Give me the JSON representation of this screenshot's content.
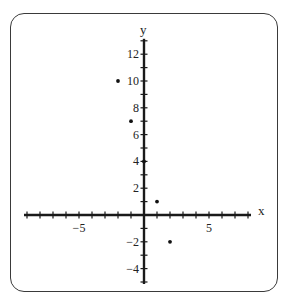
{
  "chart_data": {
    "type": "scatter",
    "title": "",
    "xlabel": "x",
    "ylabel": "y",
    "xlim": [
      -9,
      8
    ],
    "ylim": [
      -5,
      13
    ],
    "x_tick_labels": [
      {
        "value": -5,
        "label": "−5"
      },
      {
        "value": 5,
        "label": "5"
      }
    ],
    "y_tick_labels": [
      {
        "value": 12,
        "label": "12"
      },
      {
        "value": 10,
        "label": "10"
      },
      {
        "value": 8,
        "label": "8"
      },
      {
        "value": 6,
        "label": "6"
      },
      {
        "value": 4,
        "label": "4"
      },
      {
        "value": 2,
        "label": "2"
      },
      {
        "value": -2,
        "label": "−2"
      },
      {
        "value": -4,
        "label": "−4"
      }
    ],
    "x_ticks_every": 1,
    "y_ticks_every": 1,
    "grid": false,
    "points": [
      {
        "x": -2,
        "y": 10
      },
      {
        "x": -1,
        "y": 7
      },
      {
        "x": 0,
        "y": 4
      },
      {
        "x": 1,
        "y": 1
      },
      {
        "x": 2,
        "y": -2
      }
    ],
    "colors": {
      "axis": "#1a1a1a",
      "point": "#111111",
      "frame": "#3a3a3a"
    }
  }
}
